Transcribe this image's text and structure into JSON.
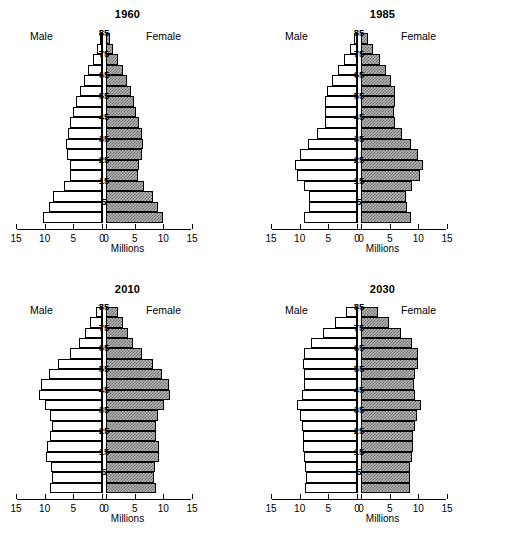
{
  "figure": {
    "axis_title": "Millions",
    "male_label": "Male",
    "female_label": "Female",
    "age_tick_labels": [
      "5",
      "15",
      "25",
      "35",
      "45",
      "55",
      "65",
      "75",
      "85"
    ],
    "x_tick_labels_left": [
      "15",
      "10",
      "5",
      "0"
    ],
    "x_tick_labels_right": [
      "0",
      "5",
      "10",
      "15"
    ],
    "colors": {
      "male_fill": "#ffffff",
      "female_fill": "#b3b3b3",
      "outline": "#000000",
      "background": "#ffffff"
    }
  },
  "chart_data": [
    {
      "type": "bar",
      "title": "1960",
      "subtitle": "",
      "xlabel": "Millions",
      "ylabel": "Age",
      "xlim": [
        -15,
        15
      ],
      "grid": false,
      "legend_position": "inline-top",
      "orientation": "population-pyramid",
      "categories": [
        "0-4",
        "5-9",
        "10-14",
        "15-19",
        "20-24",
        "25-29",
        "30-34",
        "35-39",
        "40-44",
        "45-49",
        "50-54",
        "55-59",
        "60-64",
        "65-69",
        "70-74",
        "75-79",
        "80-84",
        "85+"
      ],
      "series": [
        {
          "name": "Male",
          "values": [
            10.3,
            9.3,
            8.5,
            6.7,
            5.5,
            5.5,
            6.1,
            6.2,
            6.0,
            5.6,
            5.1,
            4.5,
            3.9,
            3.2,
            2.4,
            1.6,
            0.9,
            0.4
          ]
        },
        {
          "name": "Female",
          "values": [
            9.9,
            9.0,
            8.2,
            6.6,
            5.6,
            5.7,
            6.2,
            6.4,
            6.2,
            5.8,
            5.3,
            4.8,
            4.3,
            3.7,
            2.9,
            2.1,
            1.3,
            0.7
          ]
        }
      ]
    },
    {
      "type": "bar",
      "title": "1985",
      "subtitle": "",
      "xlabel": "Millions",
      "ylabel": "Age",
      "xlim": [
        -15,
        15
      ],
      "grid": false,
      "legend_position": "inline-top",
      "orientation": "population-pyramid",
      "categories": [
        "0-4",
        "5-9",
        "10-14",
        "15-19",
        "20-24",
        "25-29",
        "30-34",
        "35-39",
        "40-44",
        "45-49",
        "50-54",
        "55-59",
        "60-64",
        "65-69",
        "70-74",
        "75-79",
        "80-84",
        "85+"
      ],
      "series": [
        {
          "name": "Male",
          "values": [
            9.2,
            8.4,
            8.3,
            9.2,
            10.5,
            10.9,
            9.9,
            8.5,
            7.0,
            5.6,
            5.5,
            5.5,
            5.2,
            4.3,
            3.3,
            2.3,
            1.3,
            0.6
          ]
        },
        {
          "name": "Female",
          "values": [
            8.7,
            8.0,
            7.9,
            8.9,
            10.3,
            10.9,
            10.0,
            8.7,
            7.2,
            5.9,
            5.8,
            6.0,
            5.9,
            5.2,
            4.3,
            3.3,
            2.1,
            1.2
          ]
        }
      ]
    },
    {
      "type": "bar",
      "title": "2010",
      "subtitle": "",
      "xlabel": "Millions",
      "ylabel": "Age",
      "xlim": [
        -15,
        15
      ],
      "grid": false,
      "legend_position": "inline-top",
      "orientation": "population-pyramid",
      "categories": [
        "0-4",
        "5-9",
        "10-14",
        "15-19",
        "20-24",
        "25-29",
        "30-34",
        "35-39",
        "40-44",
        "45-49",
        "50-54",
        "55-59",
        "60-64",
        "65-69",
        "70-74",
        "75-79",
        "80-84",
        "85+"
      ],
      "series": [
        {
          "name": "Male",
          "values": [
            9.1,
            8.8,
            8.9,
            9.7,
            9.6,
            9.0,
            8.8,
            9.1,
            10.0,
            11.0,
            10.6,
            9.2,
            7.6,
            5.6,
            4.0,
            3.0,
            2.1,
            1.1
          ]
        },
        {
          "name": "Female",
          "values": [
            8.7,
            8.4,
            8.5,
            9.3,
            9.3,
            8.8,
            8.7,
            9.1,
            10.1,
            11.2,
            11.0,
            9.7,
            8.2,
            6.3,
            4.7,
            3.8,
            3.0,
            2.1
          ]
        }
      ]
    },
    {
      "type": "bar",
      "title": "2030",
      "subtitle": "",
      "xlabel": "Millions",
      "ylabel": "Age",
      "xlim": [
        -15,
        15
      ],
      "grid": false,
      "legend_position": "inline-top",
      "orientation": "population-pyramid",
      "categories": [
        "0-4",
        "5-9",
        "10-14",
        "15-19",
        "20-24",
        "25-29",
        "30-34",
        "35-39",
        "40-44",
        "45-49",
        "50-54",
        "55-59",
        "60-64",
        "65-69",
        "70-74",
        "75-79",
        "80-84",
        "85+"
      ],
      "series": [
        {
          "name": "Male",
          "values": [
            9.0,
            8.9,
            9.0,
            9.3,
            9.4,
            9.4,
            9.6,
            10.0,
            10.5,
            9.6,
            9.2,
            9.2,
            9.5,
            9.3,
            8.1,
            6.0,
            3.8,
            1.9
          ]
        },
        {
          "name": "Female",
          "values": [
            8.6,
            8.5,
            8.6,
            8.9,
            9.0,
            9.1,
            9.4,
            9.8,
            10.4,
            9.5,
            9.2,
            9.4,
            9.9,
            9.9,
            8.9,
            6.9,
            4.8,
            3.0
          ]
        }
      ]
    }
  ],
  "caption": ""
}
